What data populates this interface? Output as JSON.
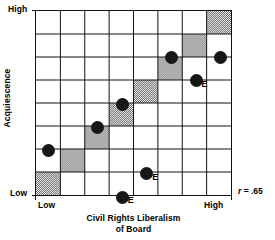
{
  "figure": {
    "y_axis_title": "Acquiescence",
    "y_tick_high": "High",
    "y_tick_low": "Low",
    "x_tick_low": "Low",
    "x_tick_high": "High",
    "x_caption_line1": "Civil Rights Liberalism",
    "x_caption_line2": "of Board",
    "r_symbol": "r",
    "r_value": "= .65",
    "point_flag_label": "E",
    "colors": {
      "ink": "#111111",
      "point_fill": "#171717",
      "shade_fill": "#8f8f8f",
      "background": "#ffffff"
    }
  },
  "chart_data": {
    "type": "scatter",
    "title": "",
    "subtitle": "",
    "xlabel": "Civil Rights Liberalism of Board",
    "ylabel": "Acquiescence",
    "xlim": [
      0,
      8
    ],
    "ylim": [
      0,
      8
    ],
    "grid": true,
    "grid_cols": 8,
    "grid_rows": 8,
    "xtick_labels": [
      "Low",
      "High"
    ],
    "ytick_labels": [
      "Low",
      "High"
    ],
    "legend": "none",
    "annotations": [
      {
        "text": "r = .65",
        "position": "bottom-right-outside"
      }
    ],
    "diagonal_shaded_cells": [
      {
        "col": 7,
        "row": 0
      },
      {
        "col": 6,
        "row": 1
      },
      {
        "col": 5,
        "row": 2
      },
      {
        "col": 4,
        "row": 3
      },
      {
        "col": 3,
        "row": 4
      },
      {
        "col": 2,
        "row": 5
      },
      {
        "col": 1,
        "row": 6
      },
      {
        "col": 0,
        "row": 7
      }
    ],
    "points": [
      {
        "col": 5,
        "row": 1,
        "x": 5.5,
        "y": 6.5,
        "flag": ""
      },
      {
        "col": 7,
        "row": 1,
        "x": 7.5,
        "y": 6.5,
        "flag": ""
      },
      {
        "col": 6,
        "row": 2,
        "x": 6.5,
        "y": 5.5,
        "flag": "E"
      },
      {
        "col": 3,
        "row": 3,
        "x": 3.5,
        "y": 4.5,
        "flag": ""
      },
      {
        "col": 2,
        "row": 4,
        "x": 2.5,
        "y": 3.5,
        "flag": ""
      },
      {
        "col": 0,
        "row": 5,
        "x": 0.5,
        "y": 2.5,
        "flag": ""
      },
      {
        "col": 4,
        "row": 6,
        "x": 4.5,
        "y": 1.5,
        "flag": "E"
      },
      {
        "col": 3,
        "row": 7,
        "x": 3.5,
        "y": 0.5,
        "flag": "E"
      }
    ]
  }
}
